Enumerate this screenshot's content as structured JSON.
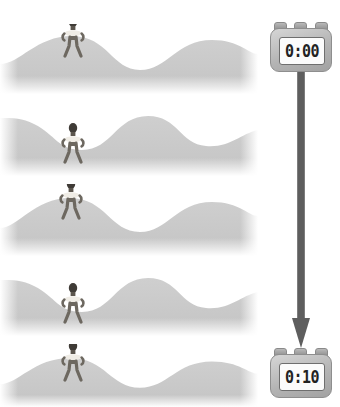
{
  "figure_illustration": {
    "title": "Athlete balancing on a moving wave over a ten second interval",
    "colors": {
      "background": "#ffffff",
      "terrain": "#c9c9c9",
      "terrain_shadow": "#bdbdbd",
      "figure_body": "#6d6860",
      "figure_dark": "#3f3b36",
      "figure_object": "#f2f0ea",
      "arrow": "#5e5e5e",
      "stopwatch_case": "#b4b4b4",
      "stopwatch_screen": "#fbfbfb",
      "digit": "#222222"
    },
    "frames": [
      {
        "index": 1,
        "label": "frame-1",
        "wave_phase_deg": 0,
        "figure_position": "crest",
        "figure_x_pct": 28,
        "person": {
          "pose": "wide-stance-squat",
          "holding": "oval-object"
        }
      },
      {
        "index": 2,
        "label": "frame-2",
        "wave_phase_deg": 180,
        "figure_position": "trough",
        "figure_x_pct": 28,
        "person": {
          "pose": "wide-stance-squat",
          "holding": "oval-object"
        }
      },
      {
        "index": 3,
        "label": "frame-3",
        "wave_phase_deg": 0,
        "figure_position": "crest",
        "figure_x_pct": 28,
        "person": {
          "pose": "wide-stance-squat",
          "holding": "oval-object"
        }
      },
      {
        "index": 4,
        "label": "frame-4",
        "wave_phase_deg": 180,
        "figure_position": "trough",
        "figure_x_pct": 28,
        "person": {
          "pose": "wide-stance-squat",
          "holding": "oval-object"
        }
      },
      {
        "index": 5,
        "label": "frame-5",
        "wave_phase_deg": 0,
        "figure_position": "crest",
        "figure_x_pct": 28,
        "person": {
          "pose": "wide-stance-squat",
          "holding": "oval-object"
        }
      }
    ],
    "timeline": {
      "start_timer": {
        "name": "stopwatch-start",
        "display": "0:00"
      },
      "end_timer": {
        "name": "stopwatch-end",
        "display": "0:10"
      },
      "arrow": {
        "name": "time-arrow",
        "direction": "down"
      }
    }
  }
}
